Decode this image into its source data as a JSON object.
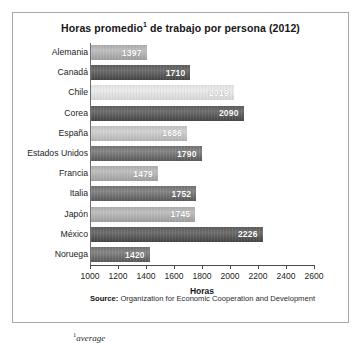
{
  "chart_data": {
    "type": "bar",
    "orientation": "horizontal",
    "title": "Horas promedio",
    "title_superscript": "1",
    "title_rest": " de trabajo por persona (2012)",
    "title_full": "Horas promedio1 de trabajo por persona (2012)",
    "xlabel": "Horas",
    "ylabel": "",
    "xlim": [
      1000,
      2600
    ],
    "xticks": [
      1000,
      1200,
      1400,
      1600,
      1800,
      2000,
      2200,
      2400,
      2600
    ],
    "grid": false,
    "legend": false,
    "categories": [
      "Alemania",
      "Canadá",
      "Chile",
      "Corea",
      "España",
      "Estados Unidos",
      "Francia",
      "Italia",
      "Japón",
      "México",
      "Noruega"
    ],
    "values": [
      1397,
      1710,
      2019,
      2090,
      1686,
      1790,
      1479,
      1752,
      1745,
      2226,
      1420
    ],
    "bars": [
      {
        "label": "Alemania",
        "value": 1397,
        "value_text": "1397",
        "shade": "sh-mid"
      },
      {
        "label": "Canadá",
        "value": 1710,
        "value_text": "1710",
        "shade": "sh-darker"
      },
      {
        "label": "Chile",
        "value": 2019,
        "value_text": "2019",
        "shade": "sh-light"
      },
      {
        "label": "Corea",
        "value": 2090,
        "value_text": "2090",
        "shade": "sh-darker"
      },
      {
        "label": "España",
        "value": 1686,
        "value_text": "1686",
        "shade": "sh-lightmid"
      },
      {
        "label": "Estados Unidos",
        "value": 1790,
        "value_text": "1790",
        "shade": "sh-dark"
      },
      {
        "label": "Francia",
        "value": 1479,
        "value_text": "1479",
        "shade": "sh-mid"
      },
      {
        "label": "Italia",
        "value": 1752,
        "value_text": "1752",
        "shade": "sh-dark"
      },
      {
        "label": "Japón",
        "value": 1745,
        "value_text": "1745",
        "shade": "sh-mid"
      },
      {
        "label": "México",
        "value": 2226,
        "value_text": "2226",
        "shade": "sh-darker"
      },
      {
        "label": "Noruega",
        "value": 1420,
        "value_text": "1420",
        "shade": "sh-dark"
      }
    ]
  },
  "notes": {
    "source_label": "Source:",
    "source_text": "Organization for Economic Cooperation and Development",
    "footnote_marker": "1",
    "footnote_text": "average"
  },
  "colors": {
    "frame_border": "#a9a9a9",
    "axis": "#4a4a4a",
    "text": "#1d1d1d",
    "value_text": "#ffffff",
    "background": "#ffffff"
  }
}
